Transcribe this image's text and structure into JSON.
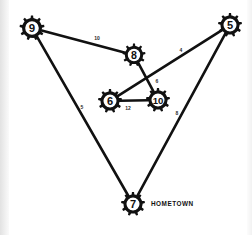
{
  "figure": {
    "kind": "weighted-graph-diagram",
    "background_color": "#ffffff",
    "ink_color": "#111111"
  },
  "chart_data": {
    "type": "diagram",
    "title": "",
    "subtitle": "",
    "xlabel": "",
    "ylabel": "",
    "layout": {
      "width": 252,
      "height": 235,
      "grid": false,
      "legend": "none"
    },
    "node_shape": "gear",
    "nodes": [
      {
        "id": "n9",
        "label": "9",
        "x": 32,
        "y": 28,
        "radius": 12.5,
        "teeth": 9
      },
      {
        "id": "n5",
        "label": "5",
        "x": 230,
        "y": 25,
        "radius": 12.0,
        "teeth": 9
      },
      {
        "id": "n8",
        "label": "8",
        "x": 134,
        "y": 55,
        "radius": 11.5,
        "teeth": 9
      },
      {
        "id": "n6",
        "label": "6",
        "x": 110,
        "y": 101,
        "radius": 12.0,
        "teeth": 9
      },
      {
        "id": "n10",
        "label": "10",
        "x": 158,
        "y": 100,
        "radius": 12.0,
        "teeth": 9
      },
      {
        "id": "n7",
        "label": "7",
        "x": 133,
        "y": 204,
        "radius": 12.0,
        "teeth": 9
      }
    ],
    "edges": [
      {
        "from": "n9",
        "to": "n8",
        "weight": "10",
        "label_x": 97,
        "label_y": 38
      },
      {
        "from": "n9",
        "to": "n7",
        "weight": "5",
        "label_x": 82,
        "label_y": 107
      },
      {
        "from": "n5",
        "to": "n6",
        "weight": "4",
        "label_x": 181,
        "label_y": 50
      },
      {
        "from": "n5",
        "to": "n7",
        "weight": "8",
        "label_x": 177,
        "label_y": 113
      },
      {
        "from": "n8",
        "to": "n10",
        "weight": "6",
        "label_x": 157,
        "label_y": 81
      },
      {
        "from": "n6",
        "to": "n10",
        "weight": "12",
        "label_x": 128,
        "label_y": 108
      }
    ],
    "annotations": [
      {
        "id": "hometown",
        "text": "HOMETOWN",
        "x": 151,
        "y": 203,
        "attached_to": "n7"
      }
    ]
  }
}
